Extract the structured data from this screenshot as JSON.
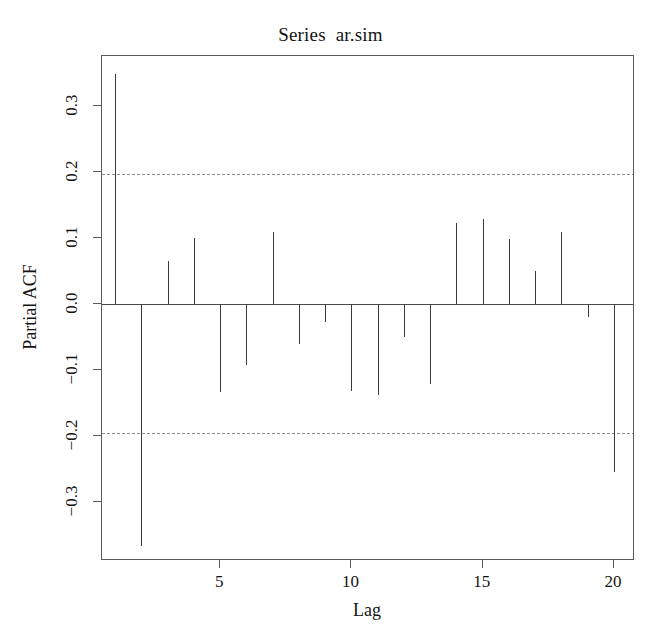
{
  "chart_data": {
    "type": "bar",
    "title": "Series  ar.sim",
    "xlabel": "Lag",
    "ylabel": "Partial ACF",
    "grid": false,
    "legend": null,
    "xlim": [
      0.5,
      20.8
    ],
    "ylim": [
      -0.39,
      0.375
    ],
    "x": [
      1,
      2,
      3,
      4,
      5,
      6,
      7,
      8,
      9,
      10,
      11,
      12,
      13,
      14,
      15,
      16,
      17,
      18,
      19,
      20
    ],
    "values": [
      0.347,
      -0.368,
      0.065,
      0.1,
      -0.134,
      -0.093,
      0.108,
      -0.062,
      -0.028,
      -0.132,
      -0.138,
      -0.05,
      -0.122,
      0.122,
      0.128,
      0.098,
      0.05,
      0.108,
      -0.02,
      -0.255
    ],
    "xticks": [
      5,
      10,
      15,
      20
    ],
    "xtick_labels": [
      "5",
      "10",
      "15",
      "20"
    ],
    "yticks": [
      -0.3,
      -0.2,
      -0.1,
      0.0,
      0.1,
      0.2,
      0.3
    ],
    "ytick_labels": [
      "-0.3",
      "-0.2",
      "-0.1",
      "0.0",
      "0.1",
      "0.2",
      "0.3"
    ],
    "confidence_bands": [
      0.196,
      -0.196
    ],
    "confidence_style": "dashed",
    "baseline": 0.0,
    "colors": {
      "bar": "#3b3b3b",
      "axis": "#5a5a5a",
      "confidence": "#8d8d8d",
      "background": "#ffffff",
      "text": "#141414"
    }
  }
}
